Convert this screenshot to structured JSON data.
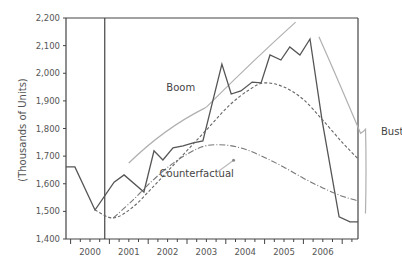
{
  "chart_data": {
    "type": "line",
    "title": "",
    "xlabel": "",
    "ylabel": "(Thousands of Units)",
    "ylim": [
      1400,
      2200
    ],
    "xlim": [
      1999.88,
      2007.41
    ],
    "yticks": [
      1400,
      1500,
      1600,
      1700,
      1800,
      1900,
      2000,
      2100,
      2200
    ],
    "ytick_labels": [
      "1,400",
      "1,500",
      "1,600",
      "1,700",
      "1,800",
      "1,900",
      "2,000",
      "2,100",
      "2,200"
    ],
    "xtick_labels": [
      "2000",
      "2001",
      "2002",
      "2003",
      "2004",
      "2005",
      "2006"
    ],
    "grid": false,
    "vertical_marker": {
      "x": 2000.88
    },
    "series": [
      {
        "name": "Actual",
        "style": "solid",
        "color": "#555555",
        "x": [
          1999.88,
          2000.11,
          2000.63,
          2001.12,
          2001.38,
          2001.89,
          2002.15,
          2002.38,
          2002.64,
          2002.9,
          2003.16,
          2003.41,
          2003.9,
          2004.14,
          2004.39,
          2004.68,
          2004.91,
          2005.14,
          2005.42,
          2005.65,
          2005.91,
          2006.17,
          2006.48,
          2006.92,
          2007.2,
          2007.41
        ],
        "values": [
          1661,
          1661,
          1505,
          1606,
          1632,
          1570,
          1719,
          1686,
          1730,
          1737,
          1748,
          1755,
          2033,
          1925,
          1936,
          1968,
          1965,
          2066,
          2048,
          2095,
          2066,
          2124,
          1831,
          1480,
          1462,
          1462
        ]
      },
      {
        "name": "Trend",
        "style": "dashed",
        "color": "#666666",
        "x": [
          2000.63,
          2001.1,
          2001.6,
          2002.1,
          2002.6,
          2003.1,
          2003.6,
          2004.1,
          2004.6,
          2005.0,
          2005.5,
          2006.0,
          2006.5,
          2007.0,
          2007.41
        ],
        "values": [
          1505,
          1476,
          1515,
          1585,
          1660,
          1735,
          1810,
          1885,
          1940,
          1965,
          1950,
          1905,
          1830,
          1750,
          1690
        ]
      },
      {
        "name": "Counterfactual",
        "style": "dashdot",
        "color": "#777777",
        "x": [
          2001.1,
          2001.6,
          2002.1,
          2002.6,
          2003.1,
          2003.5,
          2004.0,
          2004.5,
          2005.0,
          2005.5,
          2006.0,
          2006.5,
          2007.0,
          2007.41
        ],
        "values": [
          1476,
          1540,
          1610,
          1670,
          1715,
          1738,
          1740,
          1725,
          1695,
          1660,
          1620,
          1585,
          1555,
          1538
        ]
      }
    ],
    "annotations": [
      {
        "text": "Boom",
        "x": 2002.84,
        "y": 1934
      },
      {
        "text": "Counterfactual",
        "x": 2003.25,
        "y": 1624
      },
      {
        "text": "Bust",
        "x": 2008.0,
        "y": 1776
      }
    ],
    "braces": [
      {
        "name": "boom-brace",
        "from": [
          2001.5,
          1675
        ],
        "tip": [
          2003.52,
          1880
        ],
        "to": [
          2005.8,
          2185
        ]
      },
      {
        "name": "bust-brace",
        "from": [
          2006.4,
          2132
        ],
        "tip": [
          2007.55,
          1790
        ],
        "to": [
          2007.6,
          1492
        ]
      }
    ],
    "arrow": {
      "from": [
        2003.76,
        1640
      ],
      "to": [
        2004.2,
        1685
      ]
    }
  }
}
